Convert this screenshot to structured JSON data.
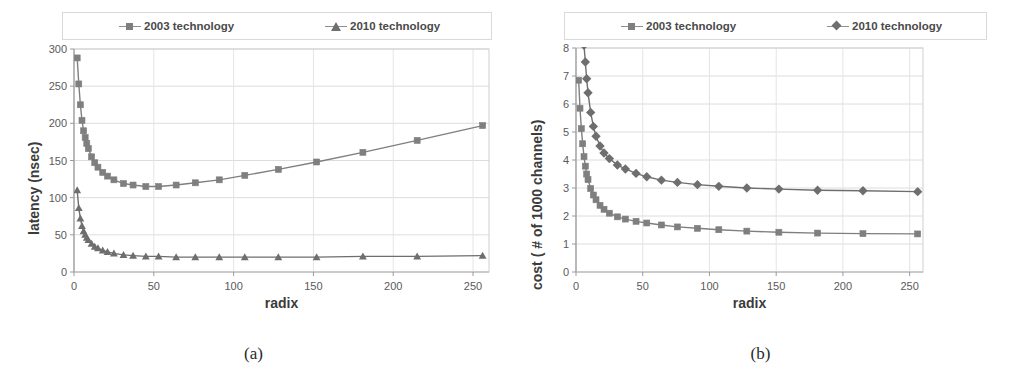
{
  "figure": {
    "caption_a": "(a)",
    "caption_b": "(b)"
  },
  "legend": {
    "series_2003": "2003 technology",
    "series_2010": "2010 technology",
    "marker_2003": "square-marker-icon",
    "marker_2010_a": "triangle-marker-icon",
    "marker_2010_b": "diamond-marker-icon",
    "color_2003": "#7f7f7f",
    "color_2010": "#6e6e6e"
  },
  "chart_data": [
    {
      "panel": "a",
      "type": "line",
      "title": "",
      "xlabel": "radix",
      "ylabel": "latency (nsec)",
      "xlim": [
        0,
        260
      ],
      "ylim": [
        0,
        300
      ],
      "xticks": [
        0,
        50,
        100,
        150,
        200,
        250
      ],
      "yticks": [
        0,
        50,
        100,
        150,
        200,
        250,
        300
      ],
      "grid": true,
      "legend_position": "top",
      "x": [
        2,
        3,
        4,
        5,
        6,
        7,
        8,
        9,
        11,
        13,
        15,
        18,
        21,
        25,
        31,
        37,
        45,
        53,
        64,
        76,
        91,
        107,
        128,
        152,
        181,
        215,
        256
      ],
      "series": [
        {
          "name": "2003 technology",
          "marker": "square",
          "color": "#7f7f7f",
          "values": [
            288,
            253,
            225,
            204,
            190,
            181,
            173,
            166,
            155,
            147,
            141,
            134,
            129,
            124,
            119,
            117,
            115,
            115,
            117,
            120,
            124,
            130,
            138,
            148,
            161,
            177,
            197
          ]
        },
        {
          "name": "2010 technology",
          "marker": "triangle",
          "color": "#6e6e6e",
          "values": [
            110,
            86,
            72,
            62,
            55,
            50,
            46,
            43,
            38,
            34,
            32,
            29,
            27,
            25,
            23,
            22,
            21,
            21,
            20,
            20,
            20,
            20,
            20,
            20,
            21,
            21,
            22
          ]
        }
      ]
    },
    {
      "panel": "b",
      "type": "line",
      "title": "",
      "xlabel": "radix",
      "ylabel": "cost ( # of 1000 channels)",
      "xlim": [
        0,
        260
      ],
      "ylim": [
        0,
        8
      ],
      "xticks": [
        0,
        50,
        100,
        150,
        200,
        250
      ],
      "yticks": [
        0,
        1,
        2,
        3,
        4,
        5,
        6,
        7,
        8
      ],
      "grid": true,
      "legend_position": "top",
      "x": [
        2,
        3,
        4,
        5,
        6,
        7,
        8,
        9,
        11,
        13,
        15,
        18,
        21,
        25,
        31,
        37,
        45,
        53,
        64,
        76,
        91,
        107,
        128,
        152,
        181,
        215,
        256
      ],
      "series": [
        {
          "name": "2003 technology",
          "marker": "square",
          "color": "#7f7f7f",
          "values": [
            6.85,
            5.85,
            5.12,
            4.58,
            4.12,
            3.78,
            3.5,
            3.3,
            2.98,
            2.75,
            2.58,
            2.38,
            2.24,
            2.1,
            1.97,
            1.89,
            1.81,
            1.75,
            1.68,
            1.61,
            1.56,
            1.51,
            1.46,
            1.42,
            1.39,
            1.37,
            1.36
          ]
        },
        {
          "name": "2010 technology",
          "marker": "diamond",
          "color": "#6e6e6e",
          "values": [
            17.5,
            12.8,
            10.4,
            9.0,
            8.1,
            7.5,
            6.9,
            6.4,
            5.7,
            5.2,
            4.85,
            4.5,
            4.25,
            4.05,
            3.82,
            3.68,
            3.52,
            3.4,
            3.28,
            3.2,
            3.12,
            3.06,
            3.0,
            2.96,
            2.92,
            2.9,
            2.87
          ]
        }
      ]
    }
  ]
}
